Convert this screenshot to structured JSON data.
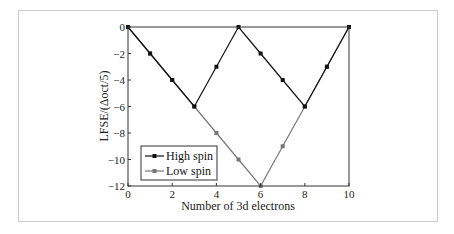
{
  "chart_data": {
    "type": "line",
    "title": "",
    "xlabel": "Number of 3d electrons",
    "ylabel": "LFSE/(Δoct/5)",
    "xlim": [
      0,
      10
    ],
    "ylim": [
      -12,
      0
    ],
    "x_ticks": [
      0,
      2,
      4,
      6,
      8,
      10
    ],
    "y_ticks": [
      0,
      -2,
      -4,
      -6,
      -8,
      -10,
      -12
    ],
    "x_tick_labels": [
      "0",
      "2",
      "4",
      "6",
      "8",
      "10"
    ],
    "y_tick_labels": [
      "0",
      "−2",
      "−4",
      "−6",
      "−8",
      "−10",
      "−12"
    ],
    "grid": false,
    "legend_position": "lower left",
    "x": [
      0,
      1,
      2,
      3,
      4,
      5,
      6,
      7,
      8,
      9,
      10
    ],
    "series": [
      {
        "name": "High spin",
        "color": "#111111",
        "marker": "square",
        "values": [
          0,
          -2,
          -4,
          -6,
          -3,
          0,
          -2,
          -4,
          -6,
          -3,
          0
        ]
      },
      {
        "name": "Low spin",
        "color": "#777777",
        "marker": "square",
        "values": [
          0,
          -2,
          -4,
          -6,
          -8,
          -10,
          -12,
          -9,
          -6,
          -3,
          0
        ]
      }
    ]
  },
  "legend": {
    "items": [
      {
        "label": "High spin"
      },
      {
        "label": "Low spin"
      }
    ]
  },
  "axes": {
    "xlabel": "Number of 3d electrons",
    "ylabel": "LFSE/(Δoct/5)"
  }
}
